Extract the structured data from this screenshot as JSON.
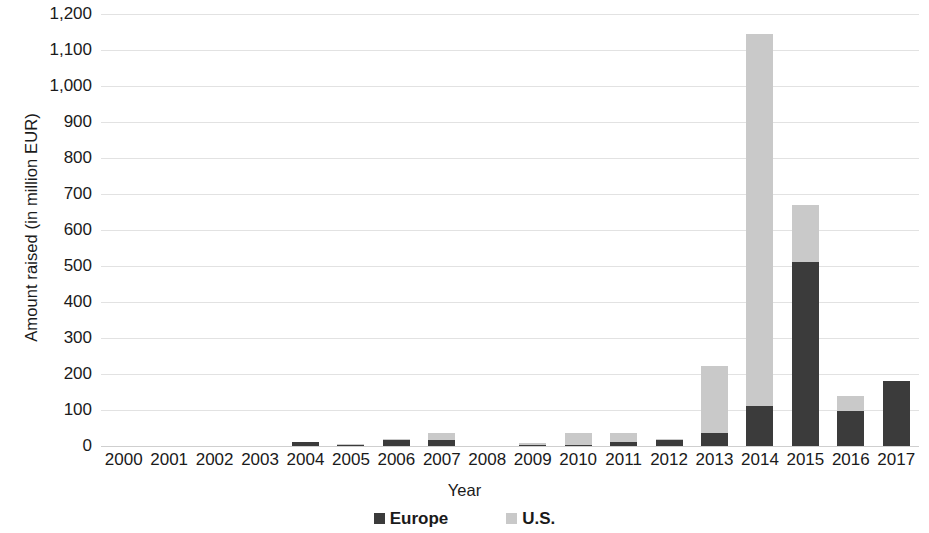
{
  "chart_data": {
    "type": "bar",
    "stacked": true,
    "title": "",
    "xlabel": "Year",
    "ylabel": "Amount raised (in million EUR)",
    "ylim": [
      0,
      1200
    ],
    "ytick_step": 100,
    "grid": true,
    "legend_position": "bottom",
    "categories": [
      "2000",
      "2001",
      "2002",
      "2003",
      "2004",
      "2005",
      "2006",
      "2007",
      "2008",
      "2009",
      "2010",
      "2011",
      "2012",
      "2013",
      "2014",
      "2015",
      "2016",
      "2017"
    ],
    "yticks": [
      "1,200",
      "1,100",
      "1,000",
      "900",
      "800",
      "700",
      "600",
      "500",
      "400",
      "300",
      "200",
      "100",
      "0"
    ],
    "ytick_values": [
      1200,
      1100,
      1000,
      900,
      800,
      700,
      600,
      500,
      400,
      300,
      200,
      100,
      0
    ],
    "series": [
      {
        "name": "Europe",
        "color": "#3b3b3b",
        "values": [
          0,
          0,
          0,
          0,
          10,
          2,
          18,
          18,
          0,
          2,
          2,
          12,
          18,
          36,
          110,
          512,
          97,
          180
        ]
      },
      {
        "name": "U.S.",
        "color": "#c9c9c9",
        "values": [
          0,
          0,
          0,
          0,
          0,
          4,
          2,
          18,
          0,
          7,
          33,
          24,
          2,
          186,
          1034,
          158,
          42,
          0
        ]
      }
    ],
    "totals": [
      0,
      0,
      0,
      0,
      10,
      6,
      20,
      36,
      0,
      9,
      35,
      36,
      20,
      222,
      1144,
      670,
      139,
      180
    ]
  },
  "legend": {
    "items": [
      {
        "label": "Europe",
        "color": "#3b3b3b",
        "swatch_name": "legend-swatch-europe"
      },
      {
        "label": "U.S.",
        "color": "#c9c9c9",
        "swatch_name": "legend-swatch-us"
      }
    ]
  },
  "colors": {
    "europe": "#3b3b3b",
    "us": "#c9c9c9",
    "gridline": "#e2e2e2",
    "text": "#1a1a1a",
    "background": "#ffffff"
  }
}
